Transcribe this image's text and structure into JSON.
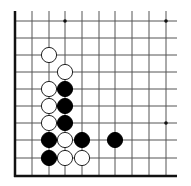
{
  "diagram": {
    "type": "go-board-fragment",
    "corner": "bottom-left",
    "edges_shown": [
      "left",
      "bottom"
    ],
    "columns": 10,
    "rows": 10,
    "origin": {
      "x": 15,
      "y": 21
    },
    "spacing": {
      "x": 16.8,
      "y": 17.2
    },
    "line_color": "#555555",
    "edge_color": "#111111",
    "star_points": [
      {
        "col": 3,
        "row": 0
      },
      {
        "col": 9,
        "row": 0
      },
      {
        "col": 9,
        "row": 6
      }
    ],
    "stones": [
      {
        "color": "white",
        "col": 2,
        "row": 2
      },
      {
        "color": "white",
        "col": 3,
        "row": 3
      },
      {
        "color": "white",
        "col": 2,
        "row": 4
      },
      {
        "color": "black",
        "col": 3,
        "row": 4
      },
      {
        "color": "white",
        "col": 2,
        "row": 5
      },
      {
        "color": "black",
        "col": 3,
        "row": 5
      },
      {
        "color": "white",
        "col": 2,
        "row": 6
      },
      {
        "color": "black",
        "col": 3,
        "row": 6
      },
      {
        "color": "black",
        "col": 2,
        "row": 7
      },
      {
        "color": "white",
        "col": 3,
        "row": 7
      },
      {
        "color": "black",
        "col": 4,
        "row": 7
      },
      {
        "color": "black",
        "col": 6,
        "row": 7
      },
      {
        "color": "black",
        "col": 2,
        "row": 8
      },
      {
        "color": "white",
        "col": 3,
        "row": 8
      },
      {
        "color": "white",
        "col": 4,
        "row": 8
      }
    ]
  }
}
